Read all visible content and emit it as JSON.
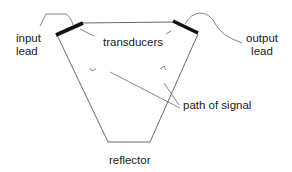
{
  "diagram": {
    "title": "",
    "labels": {
      "input_lead": [
        "input",
        "lead"
      ],
      "output_lead": [
        "output",
        "lead"
      ],
      "transducers": "transducers",
      "path_of_signal": "path of signal",
      "reflector": "reflector"
    },
    "components": [
      {
        "id": "input-transducer",
        "type": "transducer",
        "position": "top-left"
      },
      {
        "id": "output-transducer",
        "type": "transducer",
        "position": "top-right"
      },
      {
        "id": "reflector",
        "type": "reflector",
        "position": "bottom"
      },
      {
        "id": "input-lead",
        "type": "lead",
        "connects_to": "input-transducer"
      },
      {
        "id": "output-lead",
        "type": "lead",
        "connects_to": "output-transducer"
      }
    ],
    "colors": {
      "line": "#5a5a5a",
      "transducer": "#111111",
      "text": "#222222",
      "background": "#ffffff"
    }
  }
}
